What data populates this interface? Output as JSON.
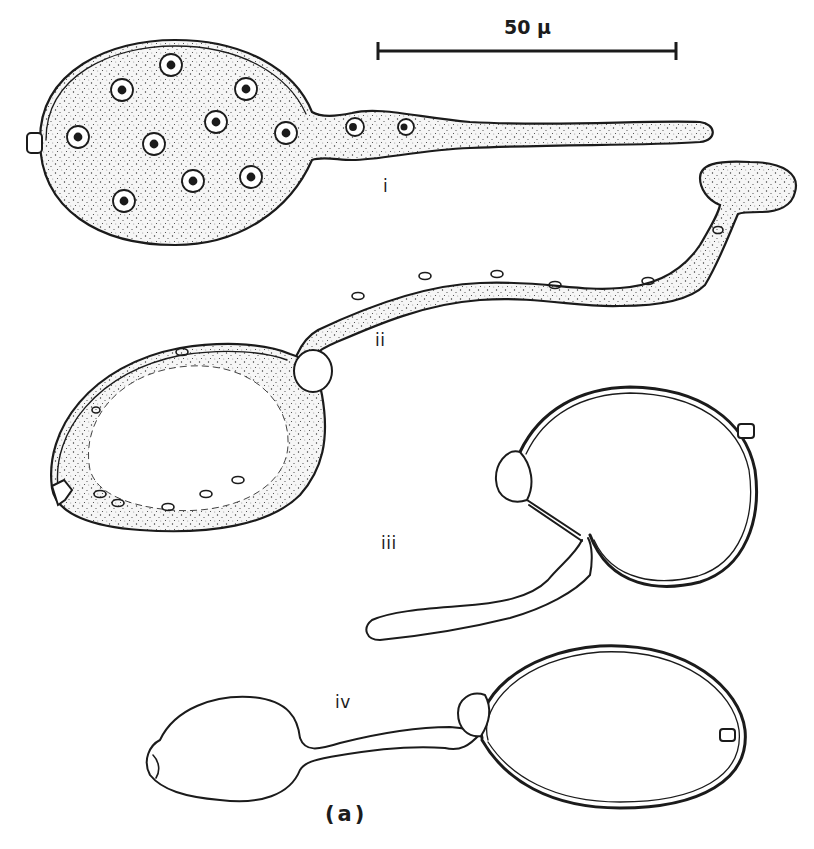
{
  "figure": {
    "panel_label": "(a)",
    "scale_bar": {
      "label": "50 µ",
      "value": 50,
      "unit": "µ"
    },
    "stages": [
      {
        "id": "i",
        "label": "i",
        "description": "Multinucleate spherical cell with emerging germ tube, cytoplasm stippled"
      },
      {
        "id": "ii",
        "label": "ii",
        "description": "Cell with long germ tube ending in swollen tip; cytoplasm migrating, vacuolated interior"
      },
      {
        "id": "iii",
        "label": "iii",
        "description": "Empty cell wall with short tube and appressorium-like swelling"
      },
      {
        "id": "iv",
        "label": "iv",
        "description": "Empty wall connected by tube to a new daughter vesicle"
      }
    ]
  },
  "colors": {
    "ink": "#1b1b1b",
    "background": "#ffffff"
  }
}
